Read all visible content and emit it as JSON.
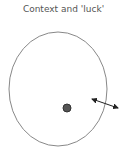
{
  "title": "Context and 'luck'",
  "diagram": {
    "boundary": {
      "shape": "ellipse",
      "stroke": "#888888"
    },
    "point": {
      "shape": "dot",
      "fill": "#555555",
      "stroke": "#333333"
    },
    "arrow": {
      "type": "double-headed",
      "color": "#222222"
    }
  }
}
